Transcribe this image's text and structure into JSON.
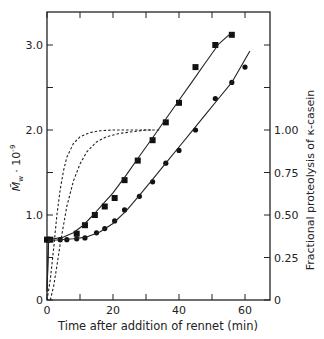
{
  "chart_data": {
    "type": "scatter",
    "title": "",
    "xlabel": "Time after addition of rennet (min)",
    "ylabel": "M̄w · 10⁻⁹",
    "ylabel_right": "Fractional proteolysis of κ-casein",
    "xlim": [
      0,
      67.5
    ],
    "ylim": [
      0,
      3.5
    ],
    "ylim_right": [
      0,
      1.75
    ],
    "x_ticks": [
      0,
      10,
      20,
      30,
      40,
      50,
      60
    ],
    "x_tick_labels": [
      "0",
      "20",
      "40",
      "60"
    ],
    "y_ticks": [
      0,
      0.5,
      1.0,
      1.5,
      2.0,
      2.5,
      3.0
    ],
    "y_tick_labels": [
      "0",
      "1.0",
      "2.0",
      "3.0"
    ],
    "y_right_ticks": [
      0,
      0.25,
      0.5,
      0.75,
      1.0,
      1.25,
      1.5
    ],
    "y_right_tick_labels": [
      "0",
      "0.25",
      "0.50",
      "0.75",
      "1.00"
    ],
    "grid": false,
    "legend": null,
    "series": [
      {
        "name": "squares",
        "marker": "square",
        "x": [
          0,
          1,
          9,
          11.5,
          14.5,
          17.5,
          20.5,
          23.5,
          27.5,
          32,
          36,
          40,
          45,
          51,
          56
        ],
        "y": [
          0.71,
          0.71,
          0.78,
          0.88,
          1.0,
          1.1,
          1.2,
          1.41,
          1.64,
          1.88,
          2.09,
          2.32,
          2.74,
          3.0,
          3.12
        ]
      },
      {
        "name": "circles",
        "marker": "circle",
        "x": [
          0,
          1,
          4,
          6,
          9,
          11.5,
          15,
          17.5,
          20.5,
          23.5,
          28,
          32,
          36,
          40,
          45,
          51,
          56,
          60
        ],
        "y": [
          0.71,
          0.71,
          0.71,
          0.71,
          0.72,
          0.73,
          0.79,
          0.84,
          0.93,
          1.06,
          1.22,
          1.39,
          1.61,
          1.76,
          2.0,
          2.37,
          2.56,
          2.74
        ]
      },
      {
        "name": "fit-squares",
        "style": "solid-line",
        "x": [
          0,
          0.5,
          2,
          5,
          8,
          11,
          14,
          17,
          20,
          24,
          28,
          32,
          36,
          40,
          44,
          48,
          52,
          56
        ],
        "y": [
          0.1,
          0.71,
          0.72,
          0.74,
          0.79,
          0.88,
          1.0,
          1.13,
          1.26,
          1.47,
          1.69,
          1.91,
          2.13,
          2.35,
          2.57,
          2.79,
          3.01,
          3.15
        ]
      },
      {
        "name": "fit-circles",
        "style": "solid-line",
        "x": [
          0,
          0.5,
          4,
          8,
          12,
          16,
          20,
          24,
          28,
          32,
          36,
          40,
          44,
          48,
          52,
          56,
          61.5
        ],
        "y": [
          0.1,
          0.7,
          0.71,
          0.72,
          0.74,
          0.8,
          0.9,
          1.05,
          1.23,
          1.42,
          1.61,
          1.8,
          1.99,
          2.18,
          2.37,
          2.56,
          2.93
        ]
      },
      {
        "name": "proteolysis-fast",
        "style": "dashed-line",
        "axis": "right",
        "x": [
          0,
          1,
          2,
          3,
          4,
          5,
          6,
          8,
          10,
          13,
          16,
          20,
          25,
          32
        ],
        "y": [
          0,
          0.12,
          0.3,
          0.5,
          0.65,
          0.76,
          0.84,
          0.92,
          0.96,
          0.985,
          0.995,
          1.0,
          1.0,
          1.0
        ]
      },
      {
        "name": "proteolysis-slow",
        "style": "dashed-line",
        "axis": "right",
        "x": [
          1,
          2,
          3,
          4,
          6,
          8,
          10,
          12,
          15,
          18,
          22,
          26,
          30,
          34
        ],
        "y": [
          0,
          0.08,
          0.2,
          0.33,
          0.55,
          0.7,
          0.8,
          0.87,
          0.93,
          0.96,
          0.98,
          0.99,
          1.0,
          1.0
        ]
      }
    ]
  },
  "labels": {
    "xlabel": "Time after addition of rennet (min)",
    "ylabel_main": "M̄",
    "ylabel_sub": "w",
    "ylabel_exp": " · 10",
    "ylabel_pow": "-9",
    "ylabel_right": "Fractional proteolysis of κ-casein"
  }
}
